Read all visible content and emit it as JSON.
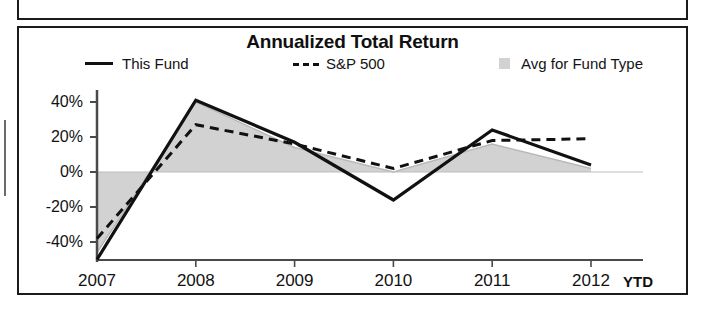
{
  "panel": {
    "title": "Annualized Total Return"
  },
  "legend": [
    {
      "label": "This Fund",
      "marker": "solid-line-swatch"
    },
    {
      "label": "S&P 500",
      "marker": "dashed-line-swatch"
    },
    {
      "label": "Avg for Fund Type",
      "marker": "gray-square-swatch"
    }
  ],
  "axis": {
    "y_ticks": [
      "40%",
      "20%",
      "0%",
      "-20%",
      "-40%"
    ],
    "x_ticks": [
      "2007",
      "2008",
      "2009",
      "2010",
      "2011",
      "2012"
    ],
    "x_note": "YTD"
  },
  "colors": {
    "fund_line": "#111111",
    "index_line": "#111111",
    "avg_fill": "#d2d2d2",
    "frame": "#1b1b1b",
    "axis": "#4a4a4a"
  },
  "chart_data": {
    "type": "line",
    "title": "Annualized Total Return",
    "xlabel": "",
    "ylabel": "",
    "x": [
      "2007",
      "2008",
      "2009",
      "2010",
      "2011",
      "2012"
    ],
    "x_note": "YTD",
    "ylim": [
      -50,
      45
    ],
    "ytick_values": [
      40,
      20,
      0,
      -20,
      -40
    ],
    "ytick_labels": [
      "40%",
      "20%",
      "0%",
      "-20%",
      "-40%"
    ],
    "grid": false,
    "legend_position": "top",
    "series": [
      {
        "name": "This Fund",
        "style": "solid",
        "render": "line",
        "values": [
          -50,
          41,
          17,
          -16,
          24,
          4
        ]
      },
      {
        "name": "S&P 500",
        "style": "dashed",
        "render": "line",
        "values": [
          -38,
          27,
          16,
          2,
          18,
          19
        ]
      },
      {
        "name": "Avg for Fund Type",
        "style": "filled",
        "render": "area",
        "values": [
          -46,
          40,
          14,
          0,
          16,
          2
        ]
      }
    ]
  }
}
